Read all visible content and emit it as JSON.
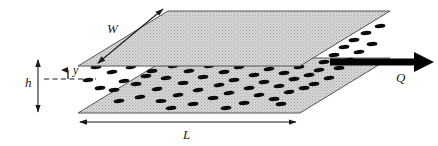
{
  "figure": {
    "type": "schematic-diagram",
    "projection": "isometric",
    "background_color": "#ffffff"
  },
  "labels": {
    "width": "W",
    "length": "L",
    "height": "h",
    "coordinate": "y",
    "flow": "Q"
  },
  "geometry": {
    "top_plate": {
      "name": "top-plate",
      "points": "168,11 390,11 300,66 78,66",
      "fill_color": "#c9c9c9",
      "stroke_color": "#4d4d4d"
    },
    "bottom_plate": {
      "name": "bottom-plate",
      "points": "168,58 390,58 300,113 78,113",
      "fill_color": "#c9c9c9",
      "stroke_color": "#4d4d4d"
    },
    "gap_label_line_y": 79,
    "height_arrow": {
      "x": 38,
      "y_top": 60,
      "y_bottom": 112
    },
    "length_arrow": {
      "y": 122,
      "x_left": 80,
      "x_right": 296
    },
    "width_arrow": {
      "x1": 98,
      "y1": 63,
      "x2": 163,
      "y2": 9
    },
    "flow_arrow": {
      "x1": 330,
      "y": 62,
      "x2": 430,
      "thickness": 7
    }
  },
  "particles": {
    "color": "#0a0a0a",
    "shape": "ellipse",
    "rx": 5.4,
    "ry": 2.1,
    "count": 62,
    "list": [
      {
        "x": 88,
        "y": 80,
        "rot": -6
      },
      {
        "x": 112,
        "y": 72,
        "rot": -8
      },
      {
        "x": 114,
        "y": 90,
        "rot": -4
      },
      {
        "x": 131,
        "y": 67,
        "rot": -10
      },
      {
        "x": 136,
        "y": 84,
        "rot": -3
      },
      {
        "x": 140,
        "y": 97,
        "rot": -7
      },
      {
        "x": 152,
        "y": 71,
        "rot": -5
      },
      {
        "x": 157,
        "y": 89,
        "rot": -9
      },
      {
        "x": 161,
        "y": 101,
        "rot": -2
      },
      {
        "x": 166,
        "y": 78,
        "rot": -6
      },
      {
        "x": 173,
        "y": 66,
        "rot": -4
      },
      {
        "x": 178,
        "y": 95,
        "rot": -8
      },
      {
        "x": 183,
        "y": 83,
        "rot": -3
      },
      {
        "x": 189,
        "y": 71,
        "rot": -7
      },
      {
        "x": 193,
        "y": 104,
        "rot": -5
      },
      {
        "x": 198,
        "y": 90,
        "rot": -9
      },
      {
        "x": 203,
        "y": 77,
        "rot": -4
      },
      {
        "x": 209,
        "y": 66,
        "rot": -6
      },
      {
        "x": 213,
        "y": 98,
        "rot": -3
      },
      {
        "x": 219,
        "y": 85,
        "rot": -8
      },
      {
        "x": 224,
        "y": 72,
        "rot": -5
      },
      {
        "x": 229,
        "y": 93,
        "rot": -7
      },
      {
        "x": 234,
        "y": 80,
        "rot": -4
      },
      {
        "x": 239,
        "y": 67,
        "rot": -9
      },
      {
        "x": 244,
        "y": 103,
        "rot": -3
      },
      {
        "x": 249,
        "y": 88,
        "rot": -6
      },
      {
        "x": 254,
        "y": 75,
        "rot": -5
      },
      {
        "x": 259,
        "y": 95,
        "rot": -8
      },
      {
        "x": 264,
        "y": 82,
        "rot": -4
      },
      {
        "x": 269,
        "y": 69,
        "rot": -7
      },
      {
        "x": 274,
        "y": 99,
        "rot": -3
      },
      {
        "x": 279,
        "y": 86,
        "rot": -6
      },
      {
        "x": 284,
        "y": 73,
        "rot": -5
      },
      {
        "x": 289,
        "y": 92,
        "rot": -9
      },
      {
        "x": 294,
        "y": 79,
        "rot": -4
      },
      {
        "x": 299,
        "y": 67,
        "rot": -7
      },
      {
        "x": 304,
        "y": 88,
        "rot": -3
      },
      {
        "x": 309,
        "y": 75,
        "rot": -6
      },
      {
        "x": 314,
        "y": 84,
        "rot": -5
      },
      {
        "x": 319,
        "y": 70,
        "rot": -8
      },
      {
        "x": 324,
        "y": 62,
        "rot": -4
      },
      {
        "x": 329,
        "y": 78,
        "rot": -7
      },
      {
        "x": 334,
        "y": 55,
        "rot": -5
      },
      {
        "x": 339,
        "y": 68,
        "rot": -3
      },
      {
        "x": 344,
        "y": 47,
        "rot": -6
      },
      {
        "x": 349,
        "y": 60,
        "rot": -8
      },
      {
        "x": 354,
        "y": 40,
        "rot": -4
      },
      {
        "x": 359,
        "y": 52,
        "rot": -7
      },
      {
        "x": 366,
        "y": 33,
        "rot": -5
      },
      {
        "x": 372,
        "y": 44,
        "rot": -3
      },
      {
        "x": 380,
        "y": 26,
        "rot": -6
      },
      {
        "x": 146,
        "y": 76,
        "rot": -5
      },
      {
        "x": 124,
        "y": 81,
        "rot": -7
      },
      {
        "x": 100,
        "y": 88,
        "rot": -4
      },
      {
        "x": 171,
        "y": 108,
        "rot": -6
      },
      {
        "x": 226,
        "y": 108,
        "rot": -5
      },
      {
        "x": 256,
        "y": 64,
        "rot": -8
      },
      {
        "x": 281,
        "y": 104,
        "rot": -4
      },
      {
        "x": 206,
        "y": 63,
        "rot": -6
      },
      {
        "x": 241,
        "y": 63,
        "rot": -5
      },
      {
        "x": 119,
        "y": 101,
        "rot": -7
      },
      {
        "x": 96,
        "y": 67,
        "rot": -5
      }
    ]
  }
}
